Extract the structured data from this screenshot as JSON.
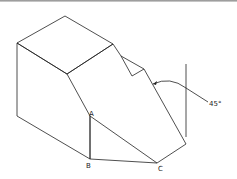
{
  "diagram": {
    "type": "isometric-solid",
    "labels": {
      "a": "A",
      "b": "B",
      "c": "C",
      "angle": "45°"
    },
    "stroke_color": "#222222"
  }
}
